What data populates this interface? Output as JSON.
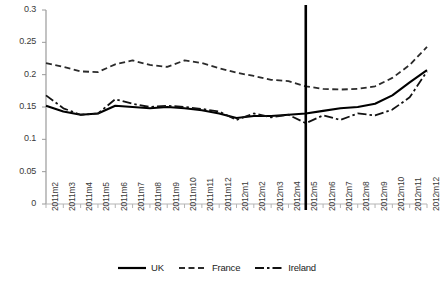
{
  "chart_data": {
    "type": "line",
    "title": "",
    "xlabel": "",
    "ylabel": "",
    "ylim": [
      0,
      0.3
    ],
    "yticks": [
      0,
      0.05,
      0.1,
      0.15,
      0.2,
      0.25,
      0.3
    ],
    "ytick_labels": [
      "0",
      "0.05",
      "0.1",
      "0.15",
      "0.2",
      "0.25",
      "0.3"
    ],
    "grid": false,
    "legend_position": "bottom",
    "categories": [
      "2011m2",
      "2011m3",
      "2011m4",
      "2011m5",
      "2011m6",
      "2011m7",
      "2011m8",
      "2011m9",
      "2011m10",
      "2011m11",
      "2011m12",
      "2012m1",
      "2012m2",
      "2012m3",
      "2012m4",
      "2012m5",
      "2012m6",
      "2012m7",
      "2012m8",
      "2012m9",
      "2012m10",
      "2012m11",
      "2012m12"
    ],
    "series": [
      {
        "name": "UK",
        "style": "solid",
        "color": "#000000",
        "values": [
          0.152,
          0.143,
          0.138,
          0.14,
          0.152,
          0.15,
          0.148,
          0.15,
          0.148,
          0.145,
          0.14,
          0.133,
          0.136,
          0.136,
          0.138,
          0.14,
          0.144,
          0.148,
          0.15,
          0.155,
          0.168,
          0.188,
          0.207
        ]
      },
      {
        "name": "France",
        "style": "dashed",
        "color": "#2b2b2b",
        "values": [
          0.218,
          0.212,
          0.205,
          0.204,
          0.216,
          0.222,
          0.215,
          0.212,
          0.222,
          0.218,
          0.21,
          0.203,
          0.198,
          0.192,
          0.19,
          0.182,
          0.178,
          0.177,
          0.178,
          0.182,
          0.195,
          0.215,
          0.243
        ]
      },
      {
        "name": "Ireland",
        "style": "dashdot",
        "color": "#111111",
        "values": [
          0.168,
          0.148,
          0.138,
          0.14,
          0.162,
          0.155,
          0.15,
          0.152,
          0.15,
          0.147,
          0.143,
          0.13,
          0.14,
          0.134,
          0.138,
          0.125,
          0.137,
          0.13,
          0.14,
          0.137,
          0.146,
          0.165,
          0.205
        ]
      }
    ],
    "annotations": [
      {
        "type": "vertical-line",
        "at_category": "2012m5",
        "color": "#000000"
      }
    ]
  },
  "legend": {
    "items": [
      {
        "label": "UK"
      },
      {
        "label": "France"
      },
      {
        "label": "Ireland"
      }
    ]
  }
}
